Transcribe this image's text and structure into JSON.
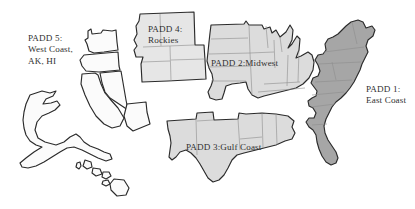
{
  "figure": {
    "name": "padd-regions-map",
    "background_color": "#ffffff",
    "width": 415,
    "height": 209,
    "outline_color": "#2b2b2b",
    "state_line_color": "#8d8d8d",
    "label_color": "#2f2f2f"
  },
  "regions": [
    {
      "id": "padd1",
      "number": "PADD 1",
      "name": "East Coast",
      "label_line1": "PADD 1:",
      "label_line2": "East Coast",
      "fill_color": "#a6a6a6",
      "states": [
        "ME",
        "NH",
        "VT",
        "MA",
        "RI",
        "CT",
        "NY",
        "PA",
        "NJ",
        "DE",
        "MD",
        "DC",
        "VA",
        "WV",
        "NC",
        "SC",
        "GA",
        "FL"
      ]
    },
    {
      "id": "padd2",
      "number": "PADD 2",
      "name": "Midwest",
      "label_line1": "PADD 2:Midwest",
      "fill_color": "#dcdcdc",
      "states": [
        "ND",
        "SD",
        "NE",
        "KS",
        "MN",
        "IA",
        "MO",
        "WI",
        "IL",
        "MI",
        "IN",
        "OH",
        "KY",
        "TN",
        "OK"
      ]
    },
    {
      "id": "padd3",
      "number": "PADD 3",
      "name": "Gulf Coast",
      "label_line1": "PADD 3:Gulf Coast",
      "fill_color": "#dcdcdc",
      "states": [
        "NM",
        "TX",
        "AR",
        "LA",
        "MS",
        "AL"
      ]
    },
    {
      "id": "padd4",
      "number": "PADD 4",
      "name": "Rockies",
      "label_line1": "PADD 4:",
      "label_line2": "Rockies",
      "fill_color": "#e6e6e6",
      "states": [
        "MT",
        "ID",
        "WY",
        "UT",
        "CO"
      ]
    },
    {
      "id": "padd5",
      "number": "PADD 5",
      "name": "West Coast, AK, HI",
      "label_line1": "PADD 5:",
      "label_line2": "West Coast,",
      "label_line3": "AK, HI",
      "fill_color": "#fbfbfb",
      "states": [
        "WA",
        "OR",
        "CA",
        "NV",
        "AZ",
        "AK",
        "HI"
      ]
    }
  ]
}
